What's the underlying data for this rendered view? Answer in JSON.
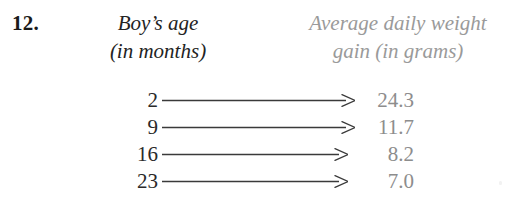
{
  "exercise": {
    "number": "12.",
    "columns": {
      "left": {
        "line1": "Boy’s age",
        "line2": "(in months)",
        "color": "#232323"
      },
      "right": {
        "line1": "Average daily weight",
        "line2": "gain (in grams)",
        "color": "#9a9a9a"
      }
    },
    "mapping": {
      "type": "arrow-diagram",
      "arrow_glyph": "long-right-arrow",
      "rows": [
        {
          "domain": "2",
          "range": "24.3",
          "arrow_length": 193
        },
        {
          "domain": "9",
          "range": "11.7",
          "arrow_length": 193
        },
        {
          "domain": "16",
          "range": "8.2",
          "arrow_length": 186
        },
        {
          "domain": "23",
          "range": "7.0",
          "arrow_length": 186
        }
      ]
    }
  },
  "chart_data": {
    "type": "table",
    "columns": [
      "Boy’s age (in months)",
      "Average daily weight gain (in grams)"
    ],
    "x": [
      2,
      9,
      16,
      23
    ],
    "values": [
      24.3,
      11.7,
      8.2,
      7.0
    ],
    "xlabel": "Boy’s age (in months)",
    "ylabel": "Average daily weight gain (in grams)"
  }
}
